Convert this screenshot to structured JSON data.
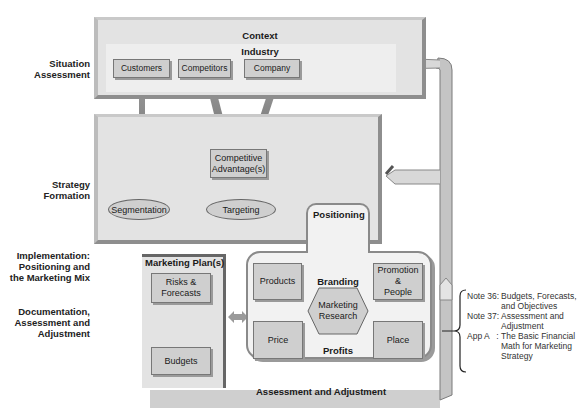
{
  "side_labels": {
    "situation": [
      "Situation",
      "Assessment"
    ],
    "strategy": [
      "Strategy",
      "Formation"
    ],
    "implementation": [
      "Implementation:",
      "Positioning and",
      "the Marketing Mix"
    ],
    "documentation": [
      "Documentation,",
      "Assessment and",
      "Adjustment"
    ]
  },
  "context": {
    "title": "Context",
    "industry": "Industry",
    "boxes": [
      "Customers",
      "Competitors",
      "Company"
    ]
  },
  "strategy": {
    "competitive_advantage": [
      "Competitive",
      "Advantage(s)"
    ],
    "segmentation": "Segmentation",
    "targeting": "Targeting"
  },
  "positioning": {
    "title": "Positioning",
    "branding": "Branding",
    "profits": "Profits",
    "products": "Products",
    "promotion": [
      "Promotion",
      "&",
      "People"
    ],
    "price": "Price",
    "place": "Place",
    "research": [
      "Marketing",
      "Research"
    ]
  },
  "marketing_plan": {
    "title": "Marketing Plan(s)",
    "risks": [
      "Risks &",
      "Forecasts"
    ],
    "budgets": "Budgets"
  },
  "assessment_bar": "Assessment and Adjustment",
  "notes": [
    {
      "key": "Note 36:",
      "lines": [
        "Budgets, Forecasts,",
        "and Objectives"
      ]
    },
    {
      "key": "Note 37:",
      "lines": [
        "Assessment and",
        "Adjustment"
      ]
    },
    {
      "key": "App A   :",
      "lines": [
        "The Basic Financial",
        "Math for Marketing",
        "Strategy"
      ]
    }
  ]
}
